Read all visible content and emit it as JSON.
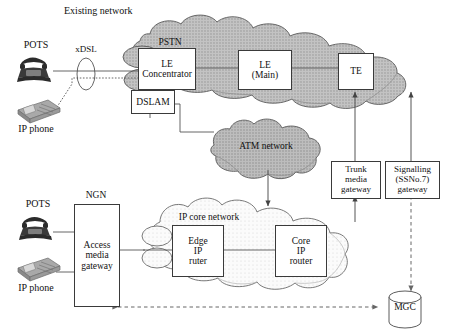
{
  "diagram": {
    "title_existing": "Existing network",
    "title_ngn": "NGN",
    "colors": {
      "pstn_cloud": "#b9b9b9",
      "atm_cloud": "#b0b0b0",
      "ip_core_cloud": "#f2f2f2",
      "box_border": "#3a3a3a",
      "line": "#555555",
      "phone_dark": "#2b2b2b",
      "phone_light": "#9a9a9a"
    }
  },
  "labels": {
    "pots_top": "POTS",
    "ip_phone_top": "IP phone",
    "xdsl": "xDSL",
    "pstn": "PSTN",
    "atm_network": "ATM network",
    "pots_bottom": "POTS",
    "ip_phone_bottom": "IP phone",
    "ip_core_network": "IP core network"
  },
  "boxes": {
    "le_concentrator": "LE\nConcentrator",
    "dslam": "DSLAM",
    "le_main": "LE\n(Main)",
    "te": "TE",
    "trunk_media_gateway": "Trunk\nmedia\ngateway",
    "signalling_gateway": "Signalling\n(SSNo.7)\ngateway",
    "access_media_gateway": "Access\nmedia\ngateway",
    "edge_ip_router": "Edge\nIP\nruter",
    "core_ip_router": "Core\nIP\nrouter",
    "mgc": "MGC"
  }
}
